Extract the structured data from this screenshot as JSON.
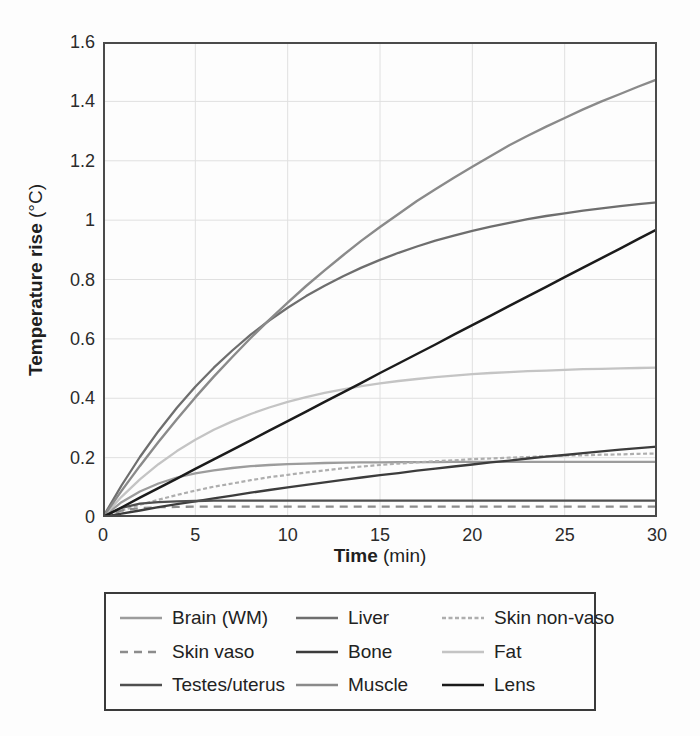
{
  "figure": {
    "y_label": "Temperature rise",
    "y_unit": " (°C)",
    "x_label": "Time",
    "x_unit": " (min)"
  },
  "chart_data": {
    "type": "line",
    "title": "",
    "xlabel": "Time (min)",
    "ylabel": "Temperature rise (°C)",
    "xlim": [
      0,
      30
    ],
    "ylim": [
      0,
      1.6
    ],
    "x_ticks": [
      0,
      5,
      10,
      15,
      20,
      25,
      30
    ],
    "x_tick_labels": [
      "0",
      "5",
      "10",
      "15",
      "20",
      "25",
      "30"
    ],
    "y_ticks": [
      0,
      0.2,
      0.4,
      0.6,
      0.8,
      1,
      1.2,
      1.4,
      1.6
    ],
    "y_tick_labels": [
      "0",
      "0.2",
      "0.4",
      "0.6",
      "0.8",
      "1",
      "1.2",
      "1.4",
      "1.6"
    ],
    "grid": true,
    "grid_color": "#e0e0e0",
    "frame_color": "#4a4a4a",
    "legend_position": "below",
    "x_step": 1,
    "series": [
      {
        "name": "Brain (WM)",
        "color": "#9c9c9c",
        "dash": "",
        "width": 2.3,
        "values": [
          0,
          0.05,
          0.086,
          0.113,
          0.133,
          0.147,
          0.157,
          0.165,
          0.171,
          0.175,
          0.178,
          0.18,
          0.182,
          0.183,
          0.184,
          0.184,
          0.185,
          0.185,
          0.185,
          0.186,
          0.186,
          0.186,
          0.186,
          0.186,
          0.186,
          0.186,
          0.186,
          0.186,
          0.186,
          0.186,
          0.186
        ]
      },
      {
        "name": "Liver",
        "color": "#6e6e6e",
        "dash": "",
        "width": 2.3,
        "values": [
          0,
          0.106,
          0.202,
          0.289,
          0.368,
          0.439,
          0.503,
          0.561,
          0.614,
          0.662,
          0.705,
          0.744,
          0.779,
          0.811,
          0.84,
          0.866,
          0.89,
          0.911,
          0.931,
          0.948,
          0.964,
          0.978,
          0.991,
          1.003,
          1.014,
          1.023,
          1.032,
          1.04,
          1.047,
          1.054,
          1.06
        ]
      },
      {
        "name": "Skin non-vaso",
        "color": "#aeaeae",
        "dash": "4,2.5",
        "width": 2.2,
        "values": [
          0,
          0.021,
          0.041,
          0.058,
          0.074,
          0.089,
          0.102,
          0.113,
          0.124,
          0.134,
          0.142,
          0.15,
          0.157,
          0.164,
          0.17,
          0.175,
          0.18,
          0.184,
          0.188,
          0.191,
          0.195,
          0.197,
          0.2,
          0.202,
          0.205,
          0.207,
          0.208,
          0.21,
          0.211,
          0.213,
          0.214
        ]
      },
      {
        "name": "Skin vaso",
        "color": "#8c8c8c",
        "dash": "8,6",
        "width": 2.3,
        "values": [
          0,
          0.022,
          0.03,
          0.033,
          0.034,
          0.035,
          0.035,
          0.035,
          0.035,
          0.035,
          0.035,
          0.035,
          0.035,
          0.035,
          0.035,
          0.035,
          0.035,
          0.035,
          0.035,
          0.035,
          0.035,
          0.035,
          0.035,
          0.035,
          0.035,
          0.035,
          0.035,
          0.035,
          0.035,
          0.035,
          0.035
        ]
      },
      {
        "name": "Bone",
        "color": "#3c3c3c",
        "dash": "",
        "width": 2.3,
        "values": [
          0,
          0.011,
          0.022,
          0.033,
          0.043,
          0.053,
          0.063,
          0.072,
          0.082,
          0.091,
          0.1,
          0.108,
          0.117,
          0.125,
          0.133,
          0.141,
          0.148,
          0.156,
          0.163,
          0.17,
          0.177,
          0.184,
          0.19,
          0.197,
          0.203,
          0.209,
          0.215,
          0.221,
          0.227,
          0.232,
          0.237
        ]
      },
      {
        "name": "Fat",
        "color": "#c4c4c4",
        "dash": "",
        "width": 2.3,
        "values": [
          0,
          0.068,
          0.127,
          0.178,
          0.222,
          0.26,
          0.294,
          0.322,
          0.347,
          0.369,
          0.388,
          0.404,
          0.418,
          0.43,
          0.441,
          0.45,
          0.458,
          0.465,
          0.471,
          0.476,
          0.481,
          0.485,
          0.488,
          0.491,
          0.493,
          0.496,
          0.498,
          0.499,
          0.501,
          0.502,
          0.503
        ]
      },
      {
        "name": "Testes/uterus",
        "color": "#4f4f4f",
        "dash": "",
        "width": 2.3,
        "values": [
          0,
          0.031,
          0.045,
          0.05,
          0.053,
          0.054,
          0.055,
          0.055,
          0.055,
          0.055,
          0.055,
          0.055,
          0.055,
          0.055,
          0.055,
          0.055,
          0.055,
          0.055,
          0.055,
          0.055,
          0.055,
          0.055,
          0.055,
          0.055,
          0.055,
          0.055,
          0.055,
          0.055,
          0.055,
          0.055,
          0.055
        ]
      },
      {
        "name": "Muscle",
        "color": "#8a8a8a",
        "dash": "",
        "width": 2.4,
        "values": [
          0,
          0.088,
          0.172,
          0.253,
          0.329,
          0.403,
          0.473,
          0.539,
          0.603,
          0.664,
          0.722,
          0.778,
          0.831,
          0.882,
          0.931,
          0.977,
          1.021,
          1.064,
          1.104,
          1.143,
          1.18,
          1.216,
          1.252,
          1.284,
          1.315,
          1.344,
          1.373,
          1.4,
          1.425,
          1.45,
          1.474
        ]
      },
      {
        "name": "Lens",
        "color": "#1b1b1b",
        "dash": "",
        "width": 2.5,
        "values": [
          0,
          0.032,
          0.065,
          0.097,
          0.129,
          0.162,
          0.194,
          0.226,
          0.258,
          0.291,
          0.323,
          0.355,
          0.388,
          0.42,
          0.452,
          0.485,
          0.517,
          0.549,
          0.581,
          0.614,
          0.646,
          0.678,
          0.711,
          0.743,
          0.775,
          0.808,
          0.84,
          0.872,
          0.904,
          0.937,
          0.969
        ]
      }
    ]
  }
}
